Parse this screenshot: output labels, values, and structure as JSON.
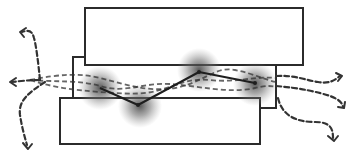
{
  "diagram": {
    "type": "layered-flow-diagram",
    "canvas": {
      "width": 357,
      "height": 162,
      "background": "#ffffff"
    },
    "colors": {
      "stroke": "#2b2b2b",
      "dash": "#333333",
      "blob": "#555555",
      "fill": "#ffffff"
    },
    "layers": [
      {
        "id": "top-layer",
        "x": 85,
        "y": 8,
        "w": 218,
        "h": 57
      },
      {
        "id": "middle-layer",
        "x": 73,
        "y": 57,
        "w": 203,
        "h": 51
      },
      {
        "id": "bottom-layer",
        "x": 60,
        "y": 98,
        "w": 200,
        "h": 46
      }
    ],
    "hotspots": [
      {
        "id": "hotspot-1",
        "cx": 100,
        "cy": 88,
        "r": 22
      },
      {
        "id": "hotspot-2",
        "cx": 140,
        "cy": 106,
        "r": 22
      },
      {
        "id": "hotspot-3",
        "cx": 199,
        "cy": 70,
        "r": 22
      },
      {
        "id": "hotspot-4",
        "cx": 255,
        "cy": 84,
        "r": 22
      }
    ],
    "solid_path": "M100,88 L138,105 L199,72 L255,83",
    "internal_dashed_paths": [
      "M30,80 C60,74 80,73 100,78 C130,86 150,92 175,88 C205,82 215,66 235,70 C255,74 265,80 276,82",
      "M30,80 C55,82 80,80 100,86 C125,94 145,82 170,84 C200,86 230,94 255,88 C268,85 272,86 276,87",
      "M30,80 C55,88 75,90 100,92 C120,93 140,96 160,90 C180,84 190,78 210,80 C235,83 255,76 276,78"
    ],
    "outgoing_arrows": {
      "left": [
        {
          "id": "arrow-left-up",
          "d": "M40,80 C38,60 36,45 34,38 C32,30 28,30 22,32",
          "head": "M26,28 L20,32 L24,37"
        },
        {
          "id": "arrow-left-mid",
          "d": "M40,80 C30,80 20,81 12,82",
          "head": "M16,78 L10,82 L16,86"
        },
        {
          "id": "arrow-left-down",
          "d": "M45,82 C30,92 18,100 20,115 C22,128 25,138 27,145",
          "head": "M23,143 L28,149 L32,144"
        }
      ],
      "right": [
        {
          "id": "arrow-right-up",
          "d": "M276,76 C295,75 305,80 318,82 C330,84 335,80 340,76",
          "head": "M336,73 L342,76 L338,81"
        },
        {
          "id": "arrow-right-mid",
          "d": "M276,86 C300,88 318,92 330,96 C338,99 342,102 343,107",
          "head": "M338,107 L344,108 L345,102"
        },
        {
          "id": "arrow-right-down",
          "d": "M278,98 C282,115 295,122 315,122 C330,122 333,128 333,138",
          "head": "M328,136 L334,141 L338,136"
        }
      ]
    }
  }
}
